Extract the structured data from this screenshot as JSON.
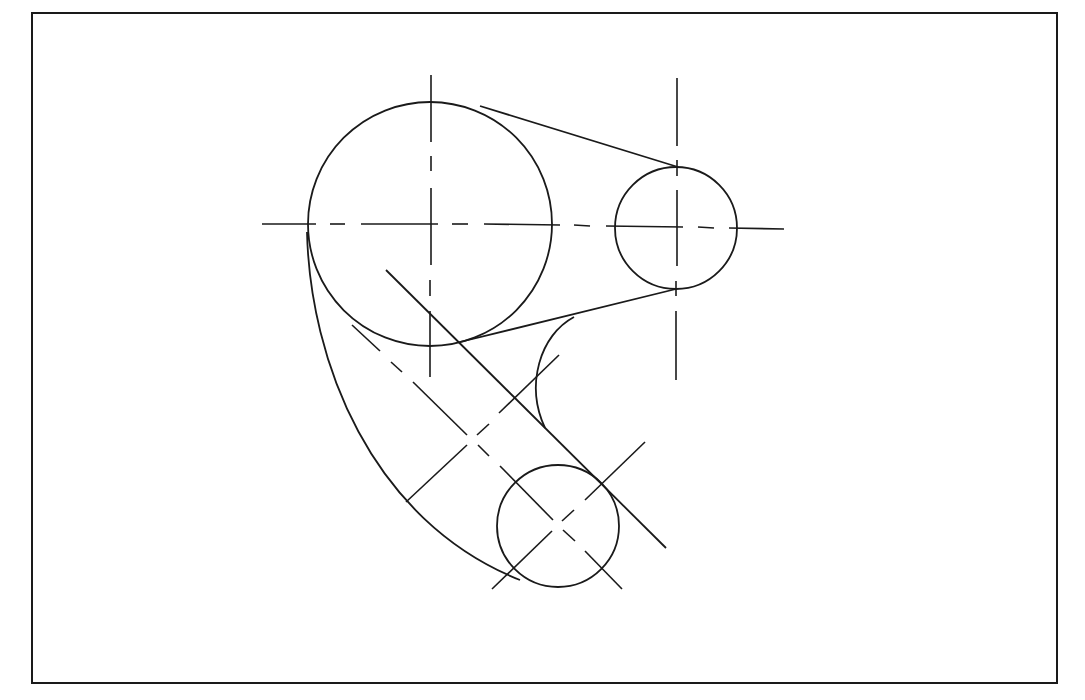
{
  "drawing": {
    "type": "engineering-geometry-construction",
    "description": "Tangent arcs and lines connecting three circles with center lines",
    "stroke_color": "#1a1a1a",
    "background": "#ffffff",
    "border": {
      "x": 32,
      "y": 13,
      "width": 1025,
      "height": 670
    },
    "circles": [
      {
        "name": "large-circle",
        "cx": 430,
        "cy": 224,
        "r": 122
      },
      {
        "name": "small-right-circle",
        "cx": 676,
        "cy": 228,
        "r": 61
      },
      {
        "name": "small-bottom-circle",
        "cx": 558,
        "cy": 526,
        "r": 61
      }
    ]
  }
}
